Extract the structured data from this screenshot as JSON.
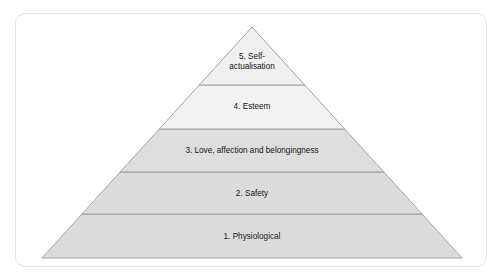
{
  "diagram": {
    "type": "pyramid",
    "name": "maslow-hierarchy-of-needs",
    "card": {
      "background_color": "#ffffff",
      "border_color": "#e3e3e3"
    },
    "outline_color": "#9a9a9a",
    "text_color": "#161616",
    "apex": {
      "x": 252,
      "y": 27
    },
    "base": {
      "left_x": 44,
      "right_x": 464,
      "y": 258
    },
    "dividers_y": [
      85,
      129,
      172,
      214
    ],
    "tiers": [
      {
        "level": 5,
        "label": "5. Self-actualisation",
        "lines": [
          "5. Self-",
          "actualisation"
        ],
        "fill_color": "#f0f0f0",
        "position": "top",
        "label_center": {
          "x": 252,
          "y": 62
        }
      },
      {
        "level": 4,
        "label": "4. Esteem",
        "lines": [
          "4. Esteem"
        ],
        "fill_color": "#f2f2f2",
        "position": "fourth",
        "label_center": {
          "x": 252,
          "y": 107
        }
      },
      {
        "level": 3,
        "label": "3. Love, affection and belongingness",
        "lines": [
          "3. Love, affection and belongingness"
        ],
        "fill_color": "#dedede",
        "position": "middle",
        "label_center": {
          "x": 252,
          "y": 151
        }
      },
      {
        "level": 2,
        "label": "2. Safety",
        "lines": [
          "2. Safety"
        ],
        "fill_color": "#dcdcdc",
        "position": "second",
        "label_center": {
          "x": 252,
          "y": 194
        }
      },
      {
        "level": 1,
        "label": "1. Physiological",
        "lines": [
          "1. Physiological"
        ],
        "fill_color": "#dcdcdc",
        "position": "base",
        "label_center": {
          "x": 252,
          "y": 237
        }
      }
    ]
  }
}
